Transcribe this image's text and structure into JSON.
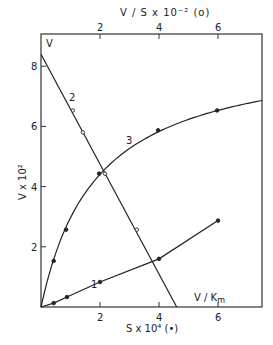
{
  "chart_data": {
    "type": "line",
    "title": "",
    "xlabel": "S x 10⁴ (•)",
    "xlabel_top": "V / S x 10⁻² (o)",
    "ylabel": "V x 10²",
    "x_ticks": [
      "2",
      "4",
      "6"
    ],
    "x_ticks_top": [
      "2",
      "4",
      "6"
    ],
    "y_ticks": [
      "2",
      "4",
      "6",
      "8"
    ],
    "xlim": [
      0,
      7.5
    ],
    "ylim": [
      0,
      9.0
    ],
    "grid": false,
    "annotations": {
      "v_label": "V",
      "vkm_label": "V / K",
      "vkm_sub": "m",
      "curve1_label": "1",
      "curve2_label": "2",
      "curve3_label": "3"
    },
    "series": [
      {
        "name": "1",
        "marker": "filled",
        "axis": "bottom",
        "x": [
          0,
          0.43,
          0.88,
          2.0,
          4.0,
          6.0
        ],
        "y": [
          0,
          0.13,
          0.33,
          0.83,
          1.6,
          2.87
        ]
      },
      {
        "name": "2",
        "marker": "open",
        "axis": "top",
        "x": [
          0,
          1.08,
          1.42,
          2.17,
          3.25,
          4.6
        ],
        "y": [
          8.4,
          6.53,
          5.8,
          4.43,
          2.57,
          0
        ]
      },
      {
        "name": "3",
        "marker": "filled",
        "axis": "bottom",
        "x": [
          0,
          0.43,
          0.85,
          1.97,
          3.97,
          5.97,
          7.5
        ],
        "y": [
          0,
          1.53,
          2.57,
          4.43,
          5.87,
          6.53,
          6.87
        ]
      }
    ]
  }
}
